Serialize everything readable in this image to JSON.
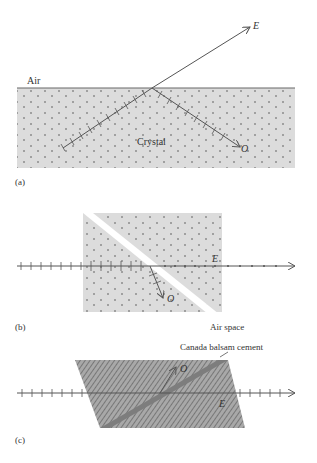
{
  "figure": {
    "panels": [
      {
        "id": "a",
        "caption": "(a)",
        "labels": {
          "medium_top": "Air",
          "medium_bottom": "Crystal",
          "ray_e": "E",
          "ray_o": "O"
        }
      },
      {
        "id": "b",
        "caption": "(b)",
        "labels": {
          "gap": "Air space",
          "ray_e": "E",
          "ray_o": "O"
        }
      },
      {
        "id": "c",
        "caption": "(c)",
        "labels": {
          "cement": "Canada balsam cement",
          "ray_e": "E",
          "ray_o": "O"
        }
      }
    ],
    "colors": {
      "crystal_fill": "#dcdcdc",
      "prism_fill": "#9a9a9a",
      "cement_fill": "#7d7d7d",
      "ray": "#555555",
      "air_space": "#ffffff"
    }
  }
}
